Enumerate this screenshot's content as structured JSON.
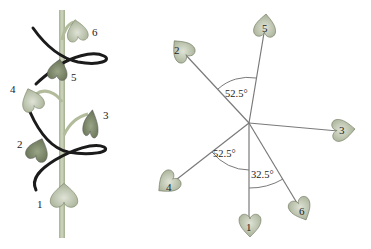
{
  "plant": {
    "leaf_labels": [
      "1",
      "2",
      "3",
      "4",
      "5",
      "6"
    ],
    "colors": {
      "stem": "#b9c3a4",
      "leaf_light": "#c6cdb8",
      "leaf_dark": "#7f8b6c",
      "spiral": "#1b1b1b"
    }
  },
  "phyllotaxis": {
    "leaf_labels": [
      "1",
      "2",
      "3",
      "4",
      "5",
      "6"
    ],
    "angles": [
      {
        "label": "52.5°",
        "between": [
          "2",
          "5"
        ]
      },
      {
        "label": "52.5°",
        "between": [
          "4",
          "1"
        ]
      },
      {
        "label": "32.5°",
        "between": [
          "1",
          "6"
        ]
      }
    ],
    "colors": {
      "ray": "#7a7a7a",
      "leaf": "#c9cec1"
    }
  }
}
